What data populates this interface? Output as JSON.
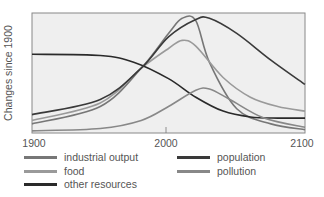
{
  "chart_data": {
    "type": "line",
    "title": "",
    "xlabel": "",
    "ylabel": "Changes since 1900",
    "xlim": [
      1900,
      2100
    ],
    "x_ticks": [
      "1900",
      "2000",
      "2100"
    ],
    "grid": false,
    "legend_position": "bottom",
    "series": [
      {
        "name": "industrial output",
        "color": "#777777",
        "points": [
          [
            1900,
            0.07
          ],
          [
            1950,
            0.22
          ],
          [
            1980,
            0.55
          ],
          [
            2000,
            0.85
          ],
          [
            2010,
            0.98
          ],
          [
            2020,
            0.96
          ],
          [
            2030,
            0.6
          ],
          [
            2050,
            0.2
          ],
          [
            2075,
            0.07
          ],
          [
            2100,
            0.02
          ]
        ]
      },
      {
        "name": "food",
        "color": "#9a9a9a",
        "points": [
          [
            1900,
            0.1
          ],
          [
            1950,
            0.25
          ],
          [
            1980,
            0.55
          ],
          [
            2000,
            0.72
          ],
          [
            2010,
            0.79
          ],
          [
            2020,
            0.74
          ],
          [
            2040,
            0.47
          ],
          [
            2060,
            0.3
          ],
          [
            2080,
            0.22
          ],
          [
            2100,
            0.18
          ]
        ]
      },
      {
        "name": "other resources",
        "color": "#2a2a2a",
        "points": [
          [
            1900,
            0.67
          ],
          [
            1950,
            0.66
          ],
          [
            1975,
            0.6
          ],
          [
            2000,
            0.46
          ],
          [
            2020,
            0.3
          ],
          [
            2040,
            0.18
          ],
          [
            2060,
            0.13
          ],
          [
            2080,
            0.12
          ],
          [
            2100,
            0.12
          ]
        ]
      },
      {
        "name": "population",
        "color": "#3a3a3a",
        "points": [
          [
            1900,
            0.15
          ],
          [
            1950,
            0.28
          ],
          [
            1980,
            0.55
          ],
          [
            2000,
            0.82
          ],
          [
            2020,
            0.97
          ],
          [
            2030,
            0.98
          ],
          [
            2050,
            0.85
          ],
          [
            2075,
            0.62
          ],
          [
            2100,
            0.41
          ]
        ]
      },
      {
        "name": "pollution",
        "color": "#888888",
        "points": [
          [
            1900,
            0.01
          ],
          [
            1950,
            0.03
          ],
          [
            1980,
            0.1
          ],
          [
            2000,
            0.22
          ],
          [
            2020,
            0.36
          ],
          [
            2030,
            0.37
          ],
          [
            2045,
            0.28
          ],
          [
            2070,
            0.12
          ],
          [
            2100,
            0.04
          ]
        ]
      }
    ]
  },
  "axis": {
    "ylabel": "Changes since 1900",
    "xticks": [
      "1900",
      "2000",
      "2100"
    ]
  },
  "legend": [
    {
      "label": "industrial output",
      "color": "#777777"
    },
    {
      "label": "food",
      "color": "#9a9a9a"
    },
    {
      "label": "other resources",
      "color": "#2a2a2a"
    },
    {
      "label": "population",
      "color": "#3a3a3a"
    },
    {
      "label": "pollution",
      "color": "#888888"
    }
  ]
}
